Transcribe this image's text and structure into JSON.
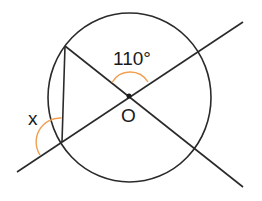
{
  "diagram": {
    "type": "circle-geometry",
    "center_label": "O",
    "angle_given": "110°",
    "angle_unknown": "x",
    "colors": {
      "line": "#2a2a2a",
      "arc": "#f0a050",
      "background": "#ffffff"
    },
    "elements": {
      "circle": {
        "cx": 129,
        "cy": 97,
        "rx": 82,
        "ry": 85
      },
      "line_a": {
        "x1": 65,
        "y1": 45,
        "x2": 243,
        "y2": 187
      },
      "line_b": {
        "x1": 17,
        "y1": 172,
        "x2": 243,
        "y2": 22
      },
      "chord": {
        "x1": 65,
        "y1": 45,
        "x2": 62,
        "y2": 142
      }
    }
  }
}
